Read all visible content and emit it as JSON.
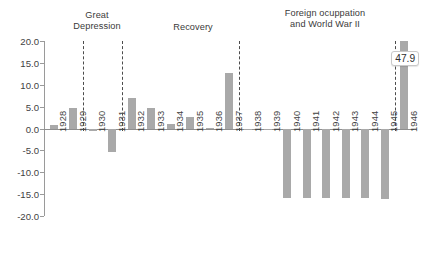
{
  "chart_data": {
    "type": "bar",
    "title": "",
    "subtitle": "",
    "xlabel": "",
    "ylabel": "",
    "ylim": [
      -20.0,
      20.0
    ],
    "ytick_step": 5.0,
    "ytick_labels": [
      "20.0",
      "15.0",
      "10.0",
      "5.0",
      "0.0",
      "-5.0",
      "-10.0",
      "-15.0",
      "-20.0"
    ],
    "ytick_values": [
      20.0,
      15.0,
      10.0,
      5.0,
      0.0,
      -5.0,
      -10.0,
      -15.0,
      -20.0
    ],
    "grid": false,
    "legend": "none",
    "bar_color": "#a9a9a9",
    "axis_color": "#9a9a9a",
    "categories": [
      "1928",
      "1929",
      "1930",
      "1931",
      "1932",
      "1933",
      "1934",
      "1935",
      "1936",
      "1937",
      "1938",
      "1939",
      "1940",
      "1941",
      "1942",
      "1943",
      "1944",
      "1945",
      "1946"
    ],
    "values": [
      0.7,
      4.8,
      -0.5,
      -5.3,
      7.0,
      4.6,
      1.0,
      2.6,
      0.1,
      12.8,
      -0.2,
      -0.2,
      -15.8,
      -15.8,
      -15.8,
      -15.8,
      -15.9,
      -16.1,
      47.9
    ],
    "clipped_points": [
      {
        "category": "1946",
        "value": 47.9,
        "display_value": "47.9",
        "clipped_at": 20.0
      }
    ],
    "data_labels": [
      {
        "category": "1946",
        "text": "47.9"
      }
    ],
    "annotations": [
      {
        "name": "great-depression",
        "text": "Great\nDepression",
        "spans": [
          "1930",
          "1931"
        ]
      },
      {
        "name": "recovery",
        "text": "Recovery",
        "spans": [
          "1932",
          "1933",
          "1934",
          "1935",
          "1936",
          "1937"
        ]
      },
      {
        "name": "foreign-occupation-wwii",
        "text": "Foreign ocuppation\nand World War II",
        "spans": [
          "1940",
          "1941",
          "1942",
          "1943",
          "1944",
          "1945"
        ]
      }
    ],
    "dividers": [
      {
        "name": "divider-1929-1930",
        "after_category": "1929"
      },
      {
        "name": "divider-1931-1932",
        "after_category": "1931"
      },
      {
        "name": "divider-1937-1938",
        "after_category": "1937"
      },
      {
        "name": "divider-1945-1946",
        "after_category": "1945"
      }
    ]
  }
}
